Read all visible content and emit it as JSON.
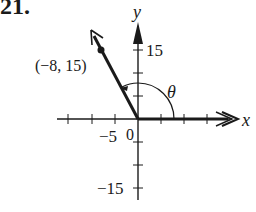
{
  "problem_number": "21.",
  "diagram": {
    "type": "angle-in-standard-position",
    "axes": {
      "x_label": "x",
      "y_label": "y",
      "origin_label": "0",
      "tick_step": 5,
      "x_tick_label": "−5",
      "y_tick_labels": {
        "top": "15",
        "bottom": "−15"
      }
    },
    "point": {
      "label": "(−8, 15)",
      "x": -8,
      "y": 15
    },
    "angle_label": "θ",
    "colors": {
      "ink": "#1a1a1a",
      "background": "#ffffff"
    }
  }
}
